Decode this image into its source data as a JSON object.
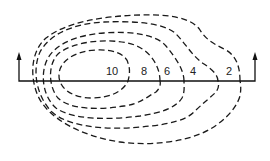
{
  "diagram": {
    "type": "contour-map",
    "stroke_color": "#1a1a1a",
    "background": "#ffffff",
    "contour_labels": [
      {
        "value": "10",
        "x": 112,
        "y": 75
      },
      {
        "value": "8",
        "x": 144,
        "y": 75
      },
      {
        "value": "6",
        "x": 165,
        "y": 75
      },
      {
        "value": "4",
        "x": 192,
        "y": 75
      },
      {
        "value": "2",
        "x": 227,
        "y": 75
      }
    ],
    "transect": {
      "y": 81,
      "x_start": 19,
      "x_end": 256,
      "left_arrow": "up",
      "right_arrow": "up"
    }
  }
}
